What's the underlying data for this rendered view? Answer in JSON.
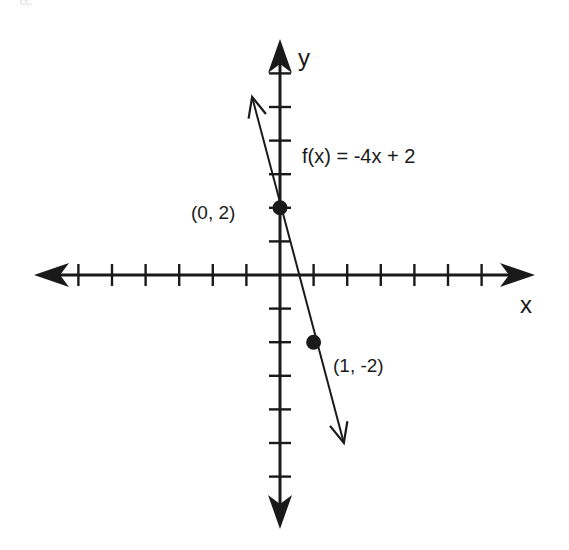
{
  "corner_text": "cc.",
  "colors": {
    "ink": "#1a1a1a",
    "background": "#ffffff"
  },
  "chart_data": {
    "type": "line",
    "title": "",
    "equation": "f(x) = -4x + 2",
    "xlabel": "x",
    "ylabel": "y",
    "xlim": [
      -7,
      7
    ],
    "ylim": [
      -7,
      7
    ],
    "x_ticks": [
      -6,
      -5,
      -4,
      -3,
      -2,
      -1,
      1,
      2,
      3,
      4,
      5,
      6
    ],
    "y_ticks": [
      -6,
      -5,
      -4,
      -3,
      -2,
      -1,
      1,
      2,
      3,
      4,
      5,
      6
    ],
    "tick_labels_shown": false,
    "grid": false,
    "series": [
      {
        "name": "f(x) = -4x + 2",
        "slope": -4,
        "intercept": 2,
        "x": [
          -0.83,
          1.9
        ],
        "y": [
          5.3,
          -5.0
        ],
        "arrows_both_ends": true
      }
    ],
    "points": [
      {
        "x": 0,
        "y": 2,
        "label": "(0, 2)"
      },
      {
        "x": 1,
        "y": -2,
        "label": "(1, -2)"
      }
    ]
  }
}
